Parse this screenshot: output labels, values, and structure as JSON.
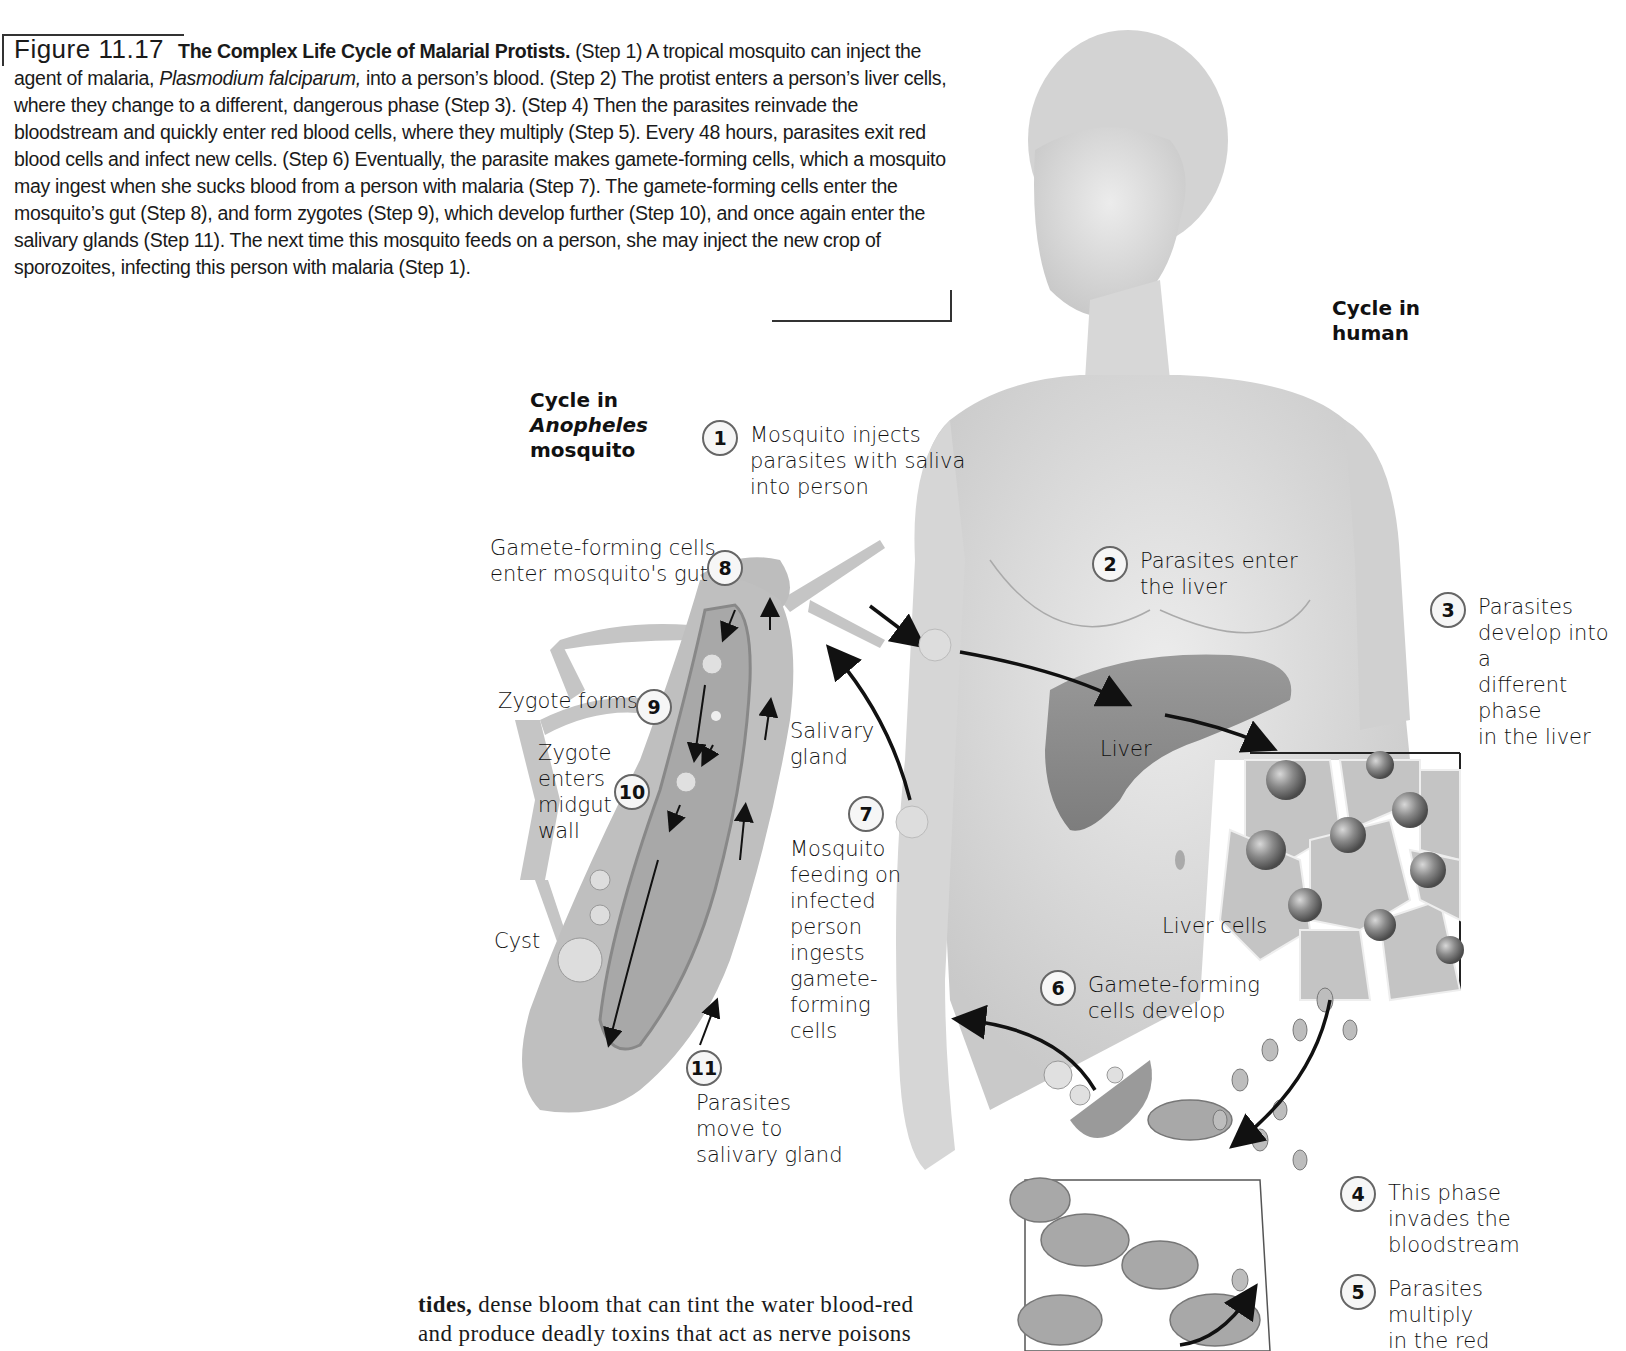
{
  "caption": {
    "figure_number": "Figure 11.17",
    "title": "The Complex Life Cycle of Malarial Protists.",
    "text_1": " (Step 1) A tropical mosquito can inject the agent of malaria, ",
    "species": "Plasmodium falciparum,",
    "text_2": " into a person’s blood. (Step 2) The protist enters a person’s liver cells, where they change to a different, dangerous phase (Step 3). (Step 4) Then the parasites reinvade the bloodstream and quickly enter red blood cells, where they multiply (Step 5). Every 48 hours, parasites exit red blood cells and infect new cells. (Step 6) Eventually, the parasite makes gamete-forming cells, which a mosquito may ingest when she sucks blood from a person with malaria (Step 7). The gamete-forming cells enter the mosquito’s gut (Step 8), and form zygotes (Step 9), which develop further (Step 10), and once again enter the salivary glands (Step 11). The next time this mosquito feeds on a person, she may inject the new crop of sporozoites, infecting this person with malaria (Step 1)."
  },
  "headings": {
    "mosquito_line1": "Cycle in",
    "mosquito_line2": "Anopheles",
    "mosquito_line3": "mosquito",
    "human_line1": "Cycle in",
    "human_line2": "human"
  },
  "steps": [
    {
      "num": "1",
      "lines": [
        "Mosquito injects",
        "parasites with saliva",
        "into person"
      ]
    },
    {
      "num": "2",
      "lines": [
        "Parasites enter",
        "the liver"
      ]
    },
    {
      "num": "3",
      "lines": [
        "Parasites",
        "develop into a",
        "different phase",
        "in the liver"
      ]
    },
    {
      "num": "4",
      "lines": [
        "This phase",
        "invades the",
        "bloodstream"
      ]
    },
    {
      "num": "5",
      "lines": [
        "Parasites",
        "multiply",
        "in the red"
      ]
    },
    {
      "num": "6",
      "lines": [
        "Gamete-forming",
        "cells develop"
      ]
    },
    {
      "num": "7",
      "lines": [
        "Mosquito",
        "feeding on",
        "infected",
        "person",
        "ingests",
        "gamete-",
        "forming",
        "cells"
      ]
    },
    {
      "num": "8",
      "lines": [
        "Gamete-forming cells",
        "enter mosquito's gut"
      ]
    },
    {
      "num": "9",
      "lines": [
        "Zygote forms"
      ]
    },
    {
      "num": "10",
      "lines": [
        "Zygote",
        "enters",
        "midgut",
        "wall"
      ]
    },
    {
      "num": "11",
      "lines": [
        "Parasites",
        "move to",
        "salivary gland"
      ]
    }
  ],
  "anatomy_labels": {
    "salivary_1": "Salivary",
    "salivary_2": "gland",
    "cyst": "Cyst",
    "liver": "Liver",
    "liver_cells": "Liver cells"
  },
  "body_text": {
    "bold": "tides,",
    "line1": " dense bloom that can tint the water blood-red",
    "line2": "and produce deadly toxins that act as nerve poisons"
  }
}
